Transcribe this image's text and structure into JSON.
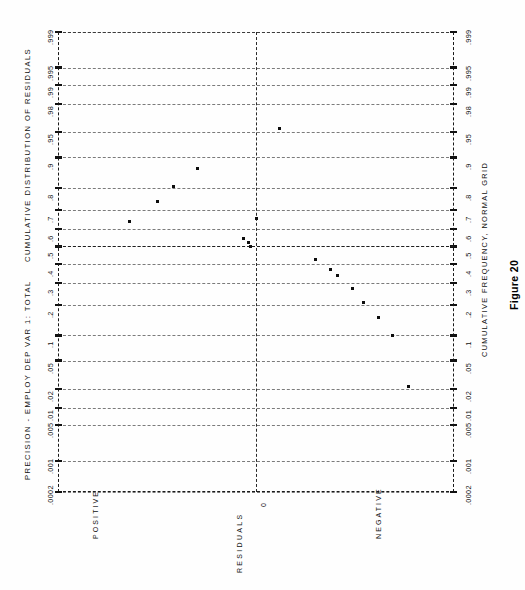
{
  "figure": {
    "number_label": "Figure 20",
    "header_left": "PRECISION - EMPLOY  DEP VAR 1: TOTAL",
    "header_title": "CUMULATIVE DISTRIBUTION OF RESIDUALS",
    "bottom_axis_title": "CUMULATIVE FREQUENCY, NORMAL GRID",
    "value_axis_label": "RESIDUALS",
    "value_axis_ticks": [
      "POSITIVE",
      "0",
      "NEGATIVE"
    ],
    "ink_color": "#111111",
    "paper_color": "#fefefe"
  },
  "chart_data": {
    "type": "scatter",
    "title": "CUMULATIVE DISTRIBUTION OF RESIDUALS",
    "subtitle": "PRECISION - EMPLOY  DEP VAR 1: TOTAL",
    "xlabel": "CUMULATIVE FREQUENCY, NORMAL GRID",
    "ylabel": "RESIDUALS",
    "orientation": "rotated-90",
    "grid": true,
    "legend": "none",
    "probability_axis": {
      "name": "CUMULATIVE FREQUENCY, NORMAL GRID",
      "scale": "normal-probability",
      "ticks": [
        ".0002",
        ".001",
        ".005",
        ".01",
        ".02",
        ".05",
        ".1",
        ".2",
        ".3",
        ".4",
        ".5",
        ".6",
        ".7",
        ".8",
        ".9",
        ".95",
        ".98",
        ".99",
        ".995",
        ".999"
      ],
      "tick_values": [
        0.0002,
        0.001,
        0.005,
        0.01,
        0.02,
        0.05,
        0.1,
        0.2,
        0.3,
        0.4,
        0.5,
        0.6,
        0.7,
        0.8,
        0.9,
        0.95,
        0.98,
        0.99,
        0.995,
        0.999
      ],
      "range": [
        0.0002,
        0.999
      ]
    },
    "residual_axis": {
      "name": "RESIDUALS",
      "ticks": [
        "POSITIVE",
        "0",
        "NEGATIVE"
      ],
      "zero_position": 0.5
    },
    "reference_lines": [
      {
        "name": "zero-residual-line",
        "axis": "residual",
        "value": 0,
        "style": "dashed"
      },
      {
        "name": "median-frequency-line",
        "axis": "probability",
        "value": 0.5,
        "style": "dashed"
      }
    ],
    "points": [
      {
        "cum_freq": 0.955,
        "residual": 0.56
      },
      {
        "cum_freq": 0.868,
        "residual": 0.352
      },
      {
        "cum_freq": 0.806,
        "residual": 0.292
      },
      {
        "cum_freq": 0.742,
        "residual": 0.25
      },
      {
        "cum_freq": 0.64,
        "residual": 0.18
      },
      {
        "cum_freq": 0.655,
        "residual": 0.5
      },
      {
        "cum_freq": 0.545,
        "residual": 0.468
      },
      {
        "cum_freq": 0.522,
        "residual": 0.48
      },
      {
        "cum_freq": 0.5,
        "residual": 0.486
      },
      {
        "cum_freq": 0.424,
        "residual": 0.65
      },
      {
        "cum_freq": 0.372,
        "residual": 0.688
      },
      {
        "cum_freq": 0.337,
        "residual": 0.707
      },
      {
        "cum_freq": 0.272,
        "residual": 0.743
      },
      {
        "cum_freq": 0.21,
        "residual": 0.772
      },
      {
        "cum_freq": 0.152,
        "residual": 0.81
      },
      {
        "cum_freq": 0.1,
        "residual": 0.845
      },
      {
        "cum_freq": 0.022,
        "residual": 0.885
      }
    ]
  }
}
